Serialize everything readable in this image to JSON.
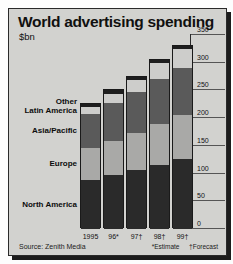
{
  "header": {
    "title": "World advertising spending",
    "subtitle": "$bn"
  },
  "source": "Source: Zenith Media",
  "footnotes": {
    "estimate": "*Estimate",
    "forecast": "†Forecast"
  },
  "chart_data": {
    "type": "bar",
    "stacked": true,
    "title": "World advertising spending",
    "subtitle": "$bn",
    "xlabel": "",
    "ylabel": "$bn",
    "ylim": [
      0,
      350
    ],
    "yticks": [
      0,
      50,
      100,
      150,
      200,
      250,
      300,
      350
    ],
    "ytick_labels": [
      "0",
      "50",
      "100",
      "150",
      "200",
      "250",
      "300",
      "350"
    ],
    "grid": true,
    "axis_position": "right",
    "legend": "inline-left-labels",
    "categories": [
      "1995",
      "96*",
      "97†",
      "98†",
      "99†"
    ],
    "category_labels_full": [
      "1995",
      "96 (estimate)",
      "97 (forecast)",
      "98 (forecast)",
      "99 (forecast)"
    ],
    "series_order_bottom_to_top": [
      "North America",
      "Europe",
      "Asia/Pacific",
      "Latin America",
      "Other"
    ],
    "series": [
      {
        "name": "North America",
        "color": "#2a2a2a",
        "values": [
          88,
          97,
          106,
          116,
          126
        ]
      },
      {
        "name": "Europe",
        "color": "#a9a9a7",
        "values": [
          58,
          62,
          68,
          74,
          79
        ]
      },
      {
        "name": "Asia/Pacific",
        "color": "#5a5a5a",
        "values": [
          62,
          68,
          73,
          80,
          86
        ]
      },
      {
        "name": "Latin America",
        "color": "#cdcdcb",
        "values": [
          12,
          17,
          22,
          29,
          33
        ]
      },
      {
        "name": "Other",
        "color": "#1e1e1e",
        "values": [
          5,
          6,
          6,
          6,
          6
        ]
      }
    ],
    "totals": [
      225,
      250,
      275,
      305,
      330
    ],
    "units": "US$ billion"
  },
  "category_labels": [
    {
      "label": "Other"
    },
    {
      "label": "Latin America"
    },
    {
      "label": "Asia/Pacific"
    },
    {
      "label": "Europe"
    },
    {
      "label": "North America"
    }
  ]
}
